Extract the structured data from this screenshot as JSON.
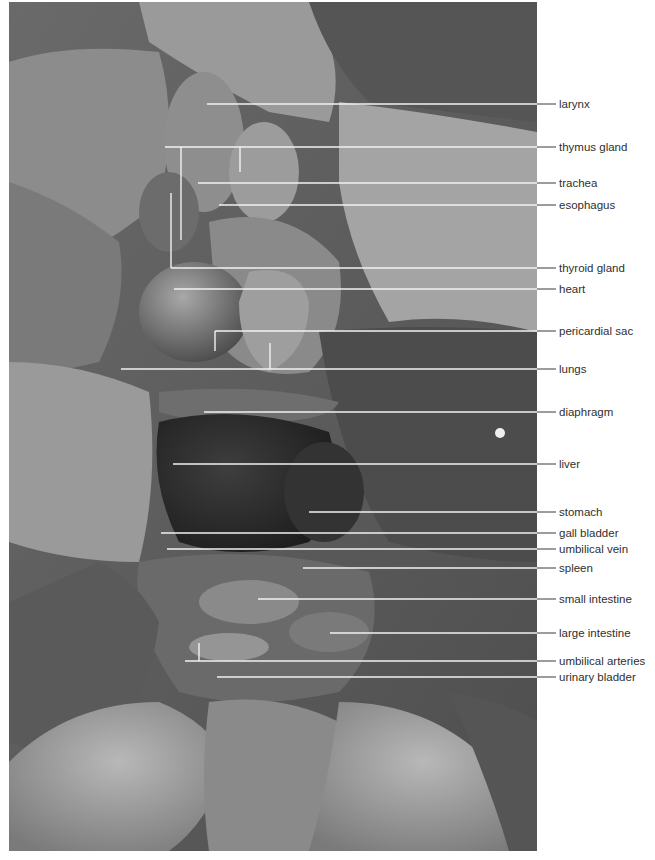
{
  "figure": {
    "photo_style": "grayscale photograph",
    "colors": {
      "background": "#ffffff",
      "photo_base": "#5c5c5c",
      "leader_line_inside_photo": "#f2f2f2",
      "leader_line_outside_photo": "#3a3a3a",
      "label_text": "#2f2f2f"
    },
    "labels": [
      {
        "id": "larynx",
        "text": "larynx",
        "y": 103
      },
      {
        "id": "thymus-gland",
        "text": "thymus gland",
        "y": 145
      },
      {
        "id": "trachea",
        "text": "trachea",
        "y": 181
      },
      {
        "id": "esophagus",
        "text": "esophagus",
        "y": 204
      },
      {
        "id": "thyroid-gland",
        "text": "thyroid gland",
        "y": 267
      },
      {
        "id": "heart",
        "text": "heart",
        "y": 288
      },
      {
        "id": "pericardial-sac",
        "text": "pericardial sac",
        "y": 329
      },
      {
        "id": "lungs",
        "text": "lungs",
        "y": 367
      },
      {
        "id": "diaphragm",
        "text": "diaphragm",
        "y": 411
      },
      {
        "id": "liver",
        "text": "liver",
        "y": 463
      },
      {
        "id": "stomach",
        "text": "stomach",
        "y": 511
      },
      {
        "id": "gall-bladder",
        "text": "gall bladder",
        "y": 531
      },
      {
        "id": "umbilical-vein",
        "text": "umbilical vein",
        "y": 548
      },
      {
        "id": "spleen",
        "text": "spleen",
        "y": 567
      },
      {
        "id": "small-intestine",
        "text": "small intestine",
        "y": 598
      },
      {
        "id": "large-intestine",
        "text": "large intestine",
        "y": 632
      },
      {
        "id": "umbilical-arteries",
        "text": "umbilical arteries",
        "y": 659
      },
      {
        "id": "urinary-bladder",
        "text": "urinary bladder",
        "y": 675
      }
    ]
  }
}
